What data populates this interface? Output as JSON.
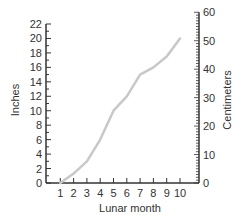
{
  "chart_data": {
    "type": "line",
    "title": "",
    "xlabel": "Lunar month",
    "ylabel": "Inches",
    "ylabel_right": "Centimeters",
    "x": [
      1,
      2,
      3,
      4,
      5,
      6,
      7,
      8,
      9,
      10
    ],
    "series": [
      {
        "name": "Length",
        "values": [
          0,
          1.3,
          3,
          6,
          10,
          12,
          15,
          16,
          17.5,
          20
        ]
      }
    ],
    "xlim": [
      0,
      10
    ],
    "ylim": [
      0,
      22
    ],
    "ylim_right": [
      0,
      60
    ],
    "x_ticks": [
      "1",
      "2",
      "3",
      "4",
      "5",
      "6",
      "7",
      "8",
      "9",
      "10"
    ],
    "y_ticks": [
      "0",
      "2",
      "4",
      "6",
      "8",
      "10",
      "12",
      "14",
      "16",
      "18",
      "20",
      "22"
    ],
    "y_ticks_right": [
      "0",
      "10",
      "20",
      "30",
      "40",
      "50",
      "60"
    ],
    "grid": false,
    "legend": "none",
    "line_color": "#c8c8c8",
    "axis_color": "#333333"
  }
}
